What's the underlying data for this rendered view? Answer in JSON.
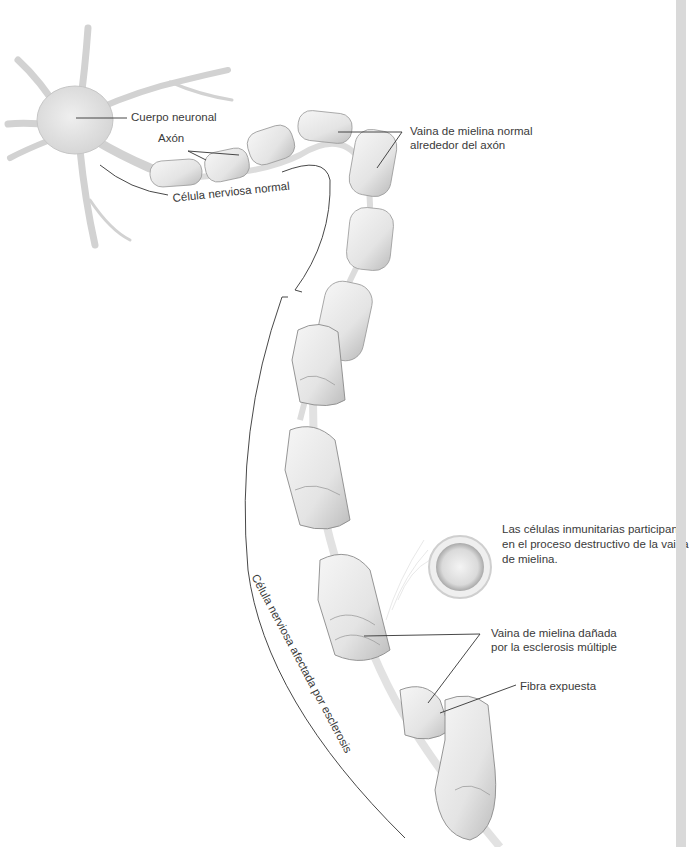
{
  "diagram": {
    "labels": {
      "cell_body": "Cuerpo neuronal",
      "axon": "Axón",
      "normal_myelin": [
        "Vaina de mielina normal",
        "alrededor del axón"
      ],
      "normal_cell": "Célula nerviosa normal",
      "affected_cell": "Célula nerviosa afectada por esclerosis",
      "immune_cells": [
        "Las células inmunitarias participan",
        "en el proceso destructivo de la vaina",
        "de mielina."
      ],
      "damaged_myelin": [
        "Vaina de mielina dañada",
        "por la esclerosis múltiple"
      ],
      "exposed_fiber": "Fibra expuesta"
    },
    "colors": {
      "background": "#ffffff",
      "tissue": "#ececec",
      "tissue_shade": "#c9c9c9",
      "outline": "#8a8a8a",
      "leader_line": "#333333",
      "edge_bar": "#d9d9d9"
    }
  }
}
